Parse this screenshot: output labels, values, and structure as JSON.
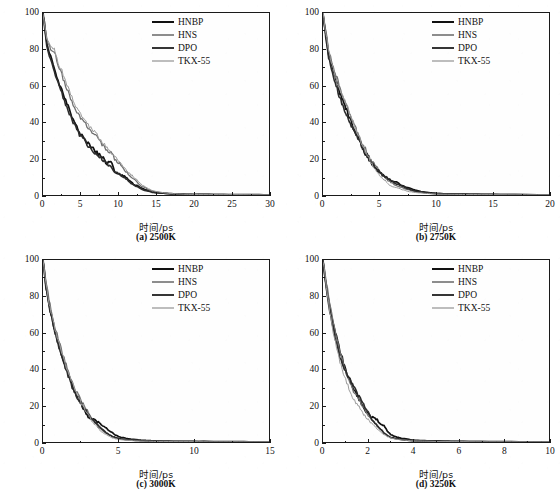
{
  "figure": {
    "y_axis_title": "原始分子的百分比/%",
    "x_axis_title": "时间/ps",
    "series_names": [
      "HNBP",
      "HNS",
      "DPO",
      "TKX-55"
    ],
    "series_colors": [
      "#111111",
      "#707070",
      "#2b2b2b",
      "#9a9a9a"
    ],
    "series_widths": [
      1.7,
      1.3,
      1.6,
      1.0
    ]
  },
  "chart_data": [
    {
      "type": "line",
      "panel": "a",
      "caption": "(a) 2500K",
      "temperature": "2500K",
      "title": "",
      "xlabel": "时间/ps",
      "ylabel": "原始分子的百分比/%",
      "xlim": [
        0,
        30
      ],
      "ylim": [
        0,
        100
      ],
      "xticks": [
        0,
        5,
        10,
        15,
        20,
        25,
        30
      ],
      "yticks": [
        0,
        20,
        40,
        60,
        80,
        100
      ],
      "grid": false,
      "legend_position": "top-right",
      "x": [
        0,
        0.5,
        1,
        1.5,
        2,
        2.5,
        3,
        3.5,
        4,
        4.5,
        5,
        5.5,
        6,
        6.5,
        7,
        7.5,
        8,
        8.5,
        9,
        9.5,
        10,
        10.5,
        11,
        11.5,
        12,
        12.5,
        13,
        13.5,
        14,
        14.5,
        15,
        16,
        17,
        18,
        19,
        20,
        22,
        24,
        26,
        28,
        30
      ],
      "series": [
        {
          "name": "HNBP",
          "values": [
            100,
            84,
            76,
            70,
            63,
            58,
            52,
            47,
            41,
            38,
            33,
            31,
            28,
            26,
            24,
            22,
            20,
            17,
            19,
            13,
            12,
            11,
            10,
            8,
            6,
            5,
            4,
            3,
            2.5,
            2,
            1.5,
            1,
            0.8,
            0.5,
            0.4,
            0.3,
            0.3,
            0.2,
            0.2,
            0.2,
            0.1
          ]
        },
        {
          "name": "HNS",
          "values": [
            100,
            85,
            81,
            79,
            72,
            66,
            60,
            55,
            50,
            46,
            42,
            40,
            37,
            35,
            33,
            30,
            27,
            25,
            23,
            20,
            18,
            16,
            13,
            11,
            9,
            7,
            5,
            4,
            3,
            2,
            1.5,
            1,
            0.7,
            0.5,
            0.4,
            0.3,
            0.2,
            0.2,
            0.2,
            0.1,
            0.1
          ]
        },
        {
          "name": "DPO",
          "values": [
            100,
            82,
            74,
            68,
            62,
            56,
            50,
            45,
            40,
            36,
            32,
            30,
            27,
            25,
            23,
            21,
            19,
            17,
            15,
            13,
            12,
            10,
            9,
            7,
            5.5,
            4.5,
            3.5,
            2.5,
            2,
            1.5,
            1.2,
            0.9,
            0.6,
            0.5,
            0.3,
            0.3,
            0.2,
            0.2,
            0.1,
            0.1,
            0.1
          ]
        },
        {
          "name": "TKX-55",
          "values": [
            100,
            86,
            82,
            80,
            73,
            68,
            62,
            57,
            52,
            48,
            44,
            42,
            38,
            36,
            34,
            31,
            29,
            26,
            24,
            22,
            19,
            17,
            14,
            12,
            10,
            8,
            6,
            4.5,
            3.5,
            2.5,
            2,
            1.2,
            0.8,
            0.6,
            0.4,
            0.3,
            0.2,
            0.2,
            0.2,
            0.1,
            0.1
          ]
        }
      ]
    },
    {
      "type": "line",
      "panel": "b",
      "caption": "(b) 2750K",
      "temperature": "2750K",
      "title": "",
      "xlabel": "时间/ps",
      "ylabel": "原始分子的百分比/%",
      "xlim": [
        0,
        20
      ],
      "ylim": [
        0,
        100
      ],
      "xticks": [
        0,
        5,
        10,
        15,
        20
      ],
      "yticks": [
        0,
        20,
        40,
        60,
        80,
        100
      ],
      "grid": false,
      "legend_position": "top-right",
      "x": [
        0,
        0.25,
        0.5,
        0.75,
        1,
        1.25,
        1.5,
        1.75,
        2,
        2.25,
        2.5,
        2.75,
        3,
        3.25,
        3.5,
        3.75,
        4,
        4.25,
        4.5,
        4.75,
        5,
        5.25,
        5.5,
        5.75,
        6,
        6.5,
        7,
        7.5,
        8,
        8.5,
        9,
        9.5,
        10,
        11,
        12,
        13,
        14,
        15,
        17,
        20
      ],
      "series": [
        {
          "name": "HNBP",
          "values": [
            100,
            88,
            78,
            72,
            66,
            61,
            56,
            52,
            48,
            44,
            40,
            36,
            33,
            30,
            26,
            23,
            20,
            18,
            16,
            14,
            12,
            11,
            10,
            9,
            8,
            7,
            5,
            4,
            3,
            2.2,
            1.6,
            1.2,
            0.9,
            0.6,
            0.5,
            0.4,
            0.4,
            0.3,
            0.2,
            0.1
          ]
        },
        {
          "name": "HNS",
          "values": [
            100,
            90,
            80,
            74,
            69,
            64,
            59,
            54,
            50,
            46,
            42,
            39,
            35,
            31,
            28,
            25,
            22,
            19,
            17,
            15,
            13,
            11,
            10,
            8,
            7,
            5,
            4,
            3,
            2,
            1.5,
            1.2,
            0.9,
            0.7,
            0.5,
            0.4,
            0.3,
            0.3,
            0.2,
            0.2,
            0.1
          ]
        },
        {
          "name": "DPO",
          "values": [
            100,
            86,
            76,
            70,
            64,
            58,
            53,
            49,
            45,
            41,
            38,
            35,
            32,
            29,
            26,
            23,
            21,
            18,
            16,
            14,
            13,
            11,
            10,
            9,
            8,
            6,
            5,
            3.5,
            2.5,
            1.8,
            1.4,
            1,
            0.8,
            0.6,
            0.4,
            0.4,
            0.3,
            0.2,
            0.2,
            0.1
          ]
        },
        {
          "name": "TKX-55",
          "values": [
            100,
            89,
            79,
            73,
            67,
            62,
            58,
            55,
            51,
            47,
            43,
            39,
            35,
            31,
            27,
            24,
            21,
            18,
            15,
            13,
            11,
            9,
            8,
            6,
            5,
            4,
            3,
            2,
            1.5,
            1.2,
            0.9,
            0.7,
            0.5,
            0.4,
            0.3,
            0.3,
            0.2,
            0.2,
            0.1,
            0.1
          ]
        }
      ]
    },
    {
      "type": "line",
      "panel": "c",
      "caption": "(c) 3000K",
      "temperature": "3000K",
      "title": "",
      "xlabel": "时间/ps",
      "ylabel": "原始分子的百分比/%",
      "xlim": [
        0,
        15
      ],
      "ylim": [
        0,
        100
      ],
      "xticks": [
        0,
        5,
        10,
        15
      ],
      "yticks": [
        0,
        20,
        40,
        60,
        80,
        100
      ],
      "grid": false,
      "legend_position": "top-right",
      "x": [
        0,
        0.2,
        0.4,
        0.6,
        0.8,
        1,
        1.2,
        1.4,
        1.6,
        1.8,
        2,
        2.2,
        2.4,
        2.6,
        2.8,
        3,
        3.2,
        3.4,
        3.6,
        3.8,
        4,
        4.2,
        4.4,
        4.6,
        4.8,
        5,
        5.5,
        6,
        6.5,
        7,
        7.5,
        8,
        9,
        10,
        11,
        12,
        13,
        14,
        15
      ],
      "series": [
        {
          "name": "HNBP",
          "values": [
            100,
            86,
            76,
            68,
            61,
            55,
            49,
            44,
            39,
            34,
            30,
            26,
            23,
            20,
            17,
            14,
            13,
            12,
            11,
            10,
            9,
            8,
            6,
            5,
            4,
            3,
            2,
            1.5,
            1,
            0.8,
            0.6,
            0.5,
            0.4,
            0.3,
            0.3,
            0.2,
            0.2,
            0.1,
            0.1
          ]
        },
        {
          "name": "HNS",
          "values": [
            100,
            88,
            78,
            70,
            63,
            57,
            51,
            46,
            41,
            36,
            32,
            28,
            25,
            22,
            19,
            16,
            13,
            11,
            9,
            7,
            6,
            5,
            4,
            3,
            2.5,
            2,
            1.4,
            1,
            0.8,
            0.6,
            0.5,
            0.4,
            0.3,
            0.2,
            0.2,
            0.1,
            0.1,
            0.1,
            0.1
          ]
        },
        {
          "name": "DPO",
          "values": [
            100,
            85,
            75,
            67,
            60,
            54,
            48,
            43,
            38,
            33,
            29,
            26,
            23,
            20,
            18,
            15,
            13,
            11,
            10,
            8,
            7,
            5,
            4,
            3,
            2.5,
            2,
            1.3,
            1,
            0.7,
            0.5,
            0.4,
            0.3,
            0.3,
            0.2,
            0.2,
            0.1,
            0.1,
            0.1,
            0.1
          ]
        },
        {
          "name": "TKX-55",
          "values": [
            100,
            87,
            77,
            69,
            62,
            56,
            50,
            45,
            40,
            35,
            31,
            27,
            24,
            21,
            18,
            15,
            12,
            10,
            8,
            6,
            5,
            4,
            3,
            2.2,
            1.8,
            1.4,
            1,
            0.7,
            0.5,
            0.4,
            0.3,
            0.3,
            0.2,
            0.2,
            0.1,
            0.1,
            0.1,
            0.1,
            0.1
          ]
        }
      ]
    },
    {
      "type": "line",
      "panel": "d",
      "caption": "(d) 3250K",
      "temperature": "3250K",
      "title": "",
      "xlabel": "时间/ps",
      "ylabel": "原始分子的百分比/%",
      "xlim": [
        0,
        10
      ],
      "ylim": [
        0,
        100
      ],
      "xticks": [
        0,
        2,
        4,
        6,
        8,
        10
      ],
      "yticks": [
        0,
        20,
        40,
        60,
        80,
        100
      ],
      "grid": false,
      "legend_position": "top-right",
      "x": [
        0,
        0.15,
        0.3,
        0.45,
        0.6,
        0.75,
        0.9,
        1.05,
        1.2,
        1.35,
        1.5,
        1.65,
        1.8,
        1.95,
        2.1,
        2.25,
        2.4,
        2.55,
        2.7,
        2.85,
        3,
        3.2,
        3.4,
        3.6,
        3.8,
        4,
        4.3,
        4.6,
        5,
        5.4,
        5.8,
        6.2,
        7,
        8,
        9,
        10
      ],
      "series": [
        {
          "name": "HNBP",
          "values": [
            100,
            86,
            74,
            65,
            57,
            50,
            44,
            38,
            34,
            30,
            26,
            22,
            19,
            16,
            14,
            13,
            12,
            10,
            9,
            6,
            4,
            3,
            2.2,
            1.8,
            1.4,
            1,
            0.8,
            0.7,
            0.6,
            0.5,
            0.4,
            0.3,
            0.2,
            0.2,
            0.1,
            0.1
          ]
        },
        {
          "name": "HNS",
          "values": [
            100,
            88,
            76,
            66,
            58,
            50,
            43,
            37,
            32,
            28,
            25,
            22,
            19,
            16,
            13,
            11,
            9,
            7,
            5,
            3.5,
            2.5,
            1.8,
            1.4,
            1.1,
            0.9,
            0.7,
            0.6,
            0.5,
            0.4,
            0.3,
            0.3,
            0.2,
            0.2,
            0.1,
            0.1,
            0.1
          ]
        },
        {
          "name": "DPO",
          "values": [
            100,
            84,
            72,
            62,
            54,
            47,
            41,
            38,
            34,
            31,
            27,
            24,
            20,
            17,
            14,
            11,
            9,
            7,
            5,
            3.5,
            2.5,
            2,
            1.5,
            1.2,
            0.9,
            0.7,
            0.6,
            0.5,
            0.4,
            0.3,
            0.3,
            0.2,
            0.2,
            0.1,
            0.1,
            0.1
          ]
        },
        {
          "name": "TKX-55",
          "values": [
            100,
            85,
            72,
            61,
            52,
            44,
            38,
            33,
            28,
            24,
            21,
            18,
            15,
            13,
            11,
            9,
            7,
            5.5,
            4,
            3,
            2.2,
            1.6,
            1.2,
            1,
            0.8,
            0.6,
            0.5,
            0.4,
            0.3,
            0.3,
            0.2,
            0.2,
            0.1,
            0.1,
            0.1,
            0.1
          ]
        }
      ]
    }
  ]
}
